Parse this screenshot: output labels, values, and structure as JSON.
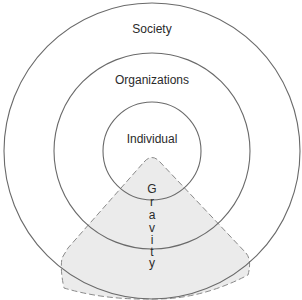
{
  "diagram": {
    "title": "",
    "rings": [
      {
        "label": "Society",
        "level": "outer"
      },
      {
        "label": "Organizations",
        "level": "middle"
      },
      {
        "label": "Individual",
        "level": "inner"
      }
    ],
    "gravity": {
      "label": "Gravity",
      "letters": [
        "G",
        "r",
        "a",
        "v",
        "i",
        "t",
        "y"
      ],
      "fill_color": "#ebebeb",
      "border_style": "dashed"
    },
    "colors": {
      "ring_stroke": "#6a6a6a",
      "text": "#2a2a2a",
      "background": "#ffffff"
    }
  }
}
